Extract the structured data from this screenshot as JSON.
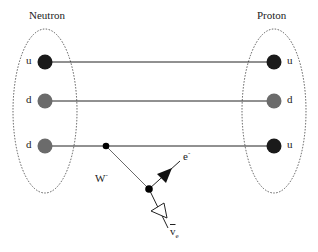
{
  "diagram": {
    "type": "feynman-beta-decay",
    "left_particle": {
      "label": "Neutron",
      "quarks": [
        {
          "flavor": "u",
          "color": "#1a1a1a"
        },
        {
          "flavor": "d",
          "color": "#6b6b6b"
        },
        {
          "flavor": "d",
          "color": "#6b6b6b"
        }
      ]
    },
    "right_particle": {
      "label": "Proton",
      "quarks": [
        {
          "flavor": "u",
          "color": "#1a1a1a"
        },
        {
          "flavor": "d",
          "color": "#6b6b6b"
        },
        {
          "flavor": "u",
          "color": "#1a1a1a"
        }
      ]
    },
    "boson": {
      "label": "W",
      "charge": "-"
    },
    "electron": {
      "label": "e",
      "charge": "-"
    },
    "neutrino": {
      "label": "v",
      "subscript": "e",
      "bar": true
    }
  }
}
